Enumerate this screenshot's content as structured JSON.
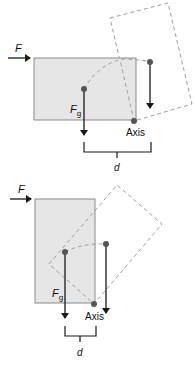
{
  "colors": {
    "block_fill": "#e6e6e6",
    "block_stroke": "#8a8a8a",
    "dashed": "#a0a0a0",
    "arrow": "#1a1a1a",
    "dot": "#555555"
  },
  "top_diagram": {
    "force_label": "F",
    "gravity_label": "F",
    "gravity_subscript": "g",
    "axis_label": "Axis",
    "distance_label": "d"
  },
  "bottom_diagram": {
    "force_label": "F",
    "gravity_label": "F",
    "gravity_subscript": "g",
    "axis_label": "Axis",
    "distance_label": "d"
  }
}
